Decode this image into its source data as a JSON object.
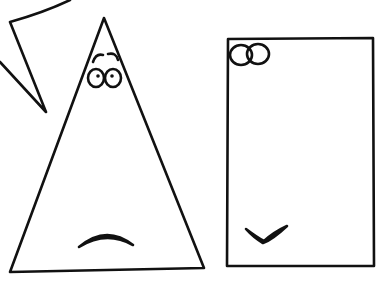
{
  "scene": {
    "description": "Hand-drawn sketch of a triangle character and a rectangle character",
    "background": "#ffffff",
    "ink": "#111111",
    "characters": [
      {
        "name": "triangle",
        "expression": "sad"
      },
      {
        "name": "rectangle",
        "expression": "smug"
      }
    ],
    "speech_bubble": {
      "text": ""
    }
  }
}
